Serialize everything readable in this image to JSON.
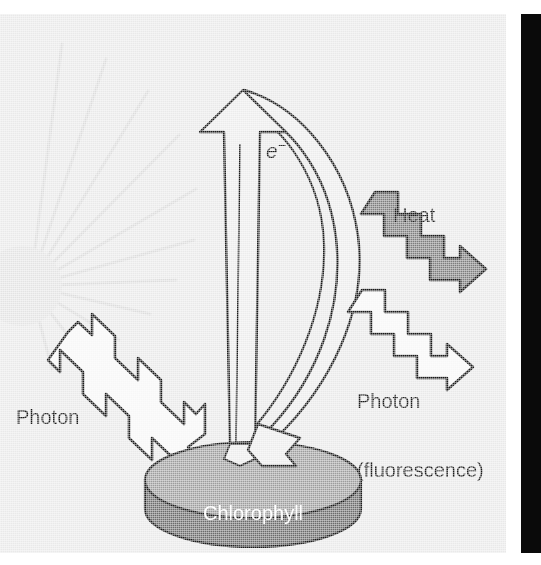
{
  "figure": {
    "panel": {
      "background_color": "#e9e9e9",
      "edge_bar_color": "#0a0a0a"
    },
    "labels": {
      "heat": "Heat",
      "photon_incoming": "Photon",
      "photon_fluorescence_line1": "Photon",
      "photon_fluorescence_line2": "(fluorescence)",
      "chlorophyll_line1": "Chlorophyll",
      "chlorophyll_line2": "molecule",
      "electron_symbol": "e",
      "electron_charge": "−"
    },
    "elements": [
      {
        "name": "sun-rays",
        "description": "Pale radiating sun rays at left edge",
        "color": "#dcdcdc"
      },
      {
        "name": "incoming-photon-arrow",
        "description": "White zigzag arrow from upper left to chlorophyll disc",
        "fill": "#f7f7f7",
        "stroke": "#1a1a1a"
      },
      {
        "name": "electron-arrow",
        "description": "Tall upward arrow labeled e minus",
        "fill": "#ececec",
        "stroke": "#1a1a1a"
      },
      {
        "name": "energy-return-arrow",
        "description": "Large curved arrow from top back down to chlorophyll disc",
        "fill": "#ececec",
        "stroke": "#1a1a1a"
      },
      {
        "name": "heat-arrow",
        "description": "Dark gray zigzag arrow pointing to lower right",
        "fill": "#7d7d7d",
        "stroke": "#1a1a1a"
      },
      {
        "name": "fluorescence-photon-arrow",
        "description": "White zigzag arrow pointing to lower right",
        "fill": "#f7f7f7",
        "stroke": "#1a1a1a"
      },
      {
        "name": "chlorophyll-disc",
        "description": "Gray cylindrical disc representing the chlorophyll molecule",
        "top_fill": "#9c9c9c",
        "side_fill": "#6b6b6b",
        "stroke": "#1a1a1a"
      }
    ],
    "colors": {
      "background": "#e9e9e9",
      "outline": "#1a1a1a",
      "arrow_fill_light": "#ececec",
      "photon_fill": "#f7f7f7",
      "heat_fill": "#7d7d7d",
      "disc_top": "#9c9c9c",
      "disc_side": "#6b6b6b",
      "ray_color": "#dcdcdc",
      "label_dark": "#1a1a1a",
      "label_light": "#ffffff"
    }
  }
}
